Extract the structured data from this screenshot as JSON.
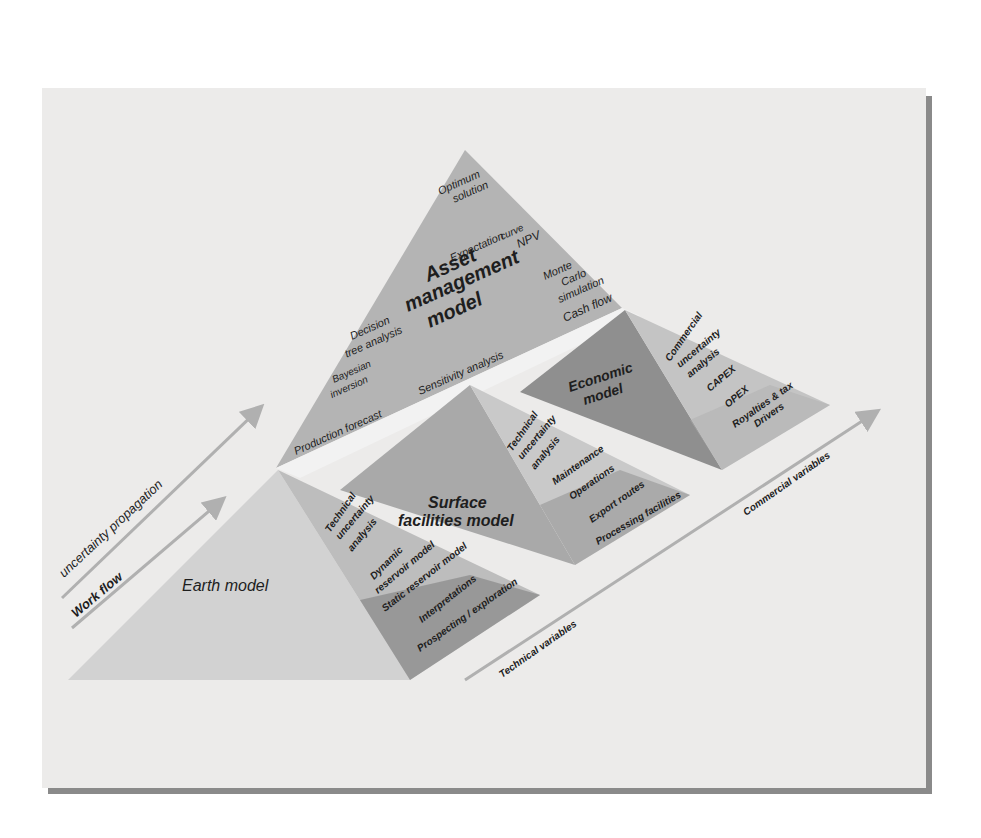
{
  "diagram": {
    "colors": {
      "panel_bg": "#ecebea",
      "asset_face": "#b4b4b4",
      "economic_face": "#8f8f8f",
      "economic_side": "#c4c4c4",
      "surface_face": "#a9a9a9",
      "surface_side": "#c9c9c9",
      "surface_side_dark": "#9c9c9c",
      "earth_face": "#d2d2d2",
      "earth_side": "#bdbdbd",
      "earth_side_dark": "#8c8c8c",
      "arrow": "#b0b0b0",
      "text": "#1e1e1e"
    },
    "asset_model": {
      "title_lines": [
        "Asset",
        "management",
        "model"
      ],
      "items": [
        "Optimum solution",
        "Expectation curve NPV",
        "Monte Carlo simulation",
        "Cash flow",
        "Decision tree analysis",
        "Bayesian inversion",
        "Sensitivity analysis",
        "Production forecast"
      ],
      "item_lines": {
        "optimum": [
          "Optimum",
          "solution"
        ],
        "expectation": [
          "Expectation",
          "curve",
          "NPV"
        ],
        "monte_carlo": [
          "Monte",
          "Carlo",
          "simulation"
        ],
        "cash_flow": "Cash flow",
        "decision": [
          "Decision",
          "tree analysis"
        ],
        "bayesian": [
          "Bayesian",
          "inversion"
        ],
        "sensitivity": "Sensitivity analysis",
        "production": "Production forecast"
      }
    },
    "economic_model": {
      "title_lines": [
        "Economic",
        "model"
      ],
      "items": [
        "Commercial uncertainty analysis",
        "CAPEX",
        "OPEX",
        "Royalties & tax",
        "Drivers"
      ],
      "item_lines": {
        "commercial": [
          "Commercial",
          "uncertainty",
          "analysis"
        ],
        "capex": "CAPEX",
        "opex": "OPEX",
        "royalties": [
          "Royalties & tax",
          "Drivers"
        ]
      }
    },
    "surface_model": {
      "title_lines": [
        "Surface",
        "facilities model"
      ],
      "items": [
        "Technical uncertainty analysis",
        "Maintenance",
        "Operations",
        "Export routes",
        "Processing facilities"
      ],
      "item_lines": {
        "technical": [
          "Technical",
          "uncertainty",
          "analysis"
        ],
        "maintenance": "Maintenance",
        "operations": "Operations",
        "export": "Export routes",
        "processing": "Processing facilities"
      }
    },
    "earth_model": {
      "title": "Earth model",
      "items": [
        "Technical uncertainty analysis",
        "Dynamic reservoir model",
        "Static reservoir model",
        "Interpretations",
        "Prospecting / exploration"
      ],
      "item_lines": {
        "technical": [
          "Technical",
          "uncertainty",
          "analysis"
        ],
        "dynamic": [
          "Dynamic",
          "reservoir model"
        ],
        "static": "Static reservoir model",
        "interpretations": "Interpretations",
        "prospecting": "Prospecting / exploration"
      }
    },
    "arrows": {
      "uncertainty": "uncertainty propagation",
      "workflow": "Work flow",
      "technical": "Technical variables",
      "commercial": "Commercial variables"
    }
  }
}
